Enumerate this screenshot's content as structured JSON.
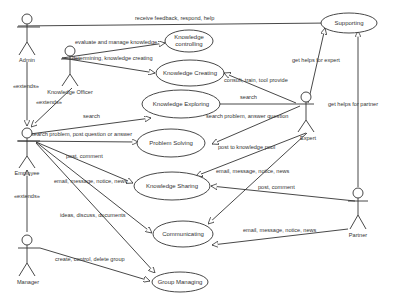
{
  "diagram": {
    "type": "uml-use-case",
    "actors": [
      {
        "id": "admin",
        "label": "Admin"
      },
      {
        "id": "knowledge_officer",
        "label": "Knowledge Officer"
      },
      {
        "id": "employee",
        "label": "Employee"
      },
      {
        "id": "manager",
        "label": "Manager"
      },
      {
        "id": "expert",
        "label": "Expert"
      },
      {
        "id": "partner",
        "label": "Partner"
      }
    ],
    "use_cases": [
      {
        "id": "supporting",
        "label": "Supporting"
      },
      {
        "id": "knowledge_controlling",
        "label_line1": "Knowledge",
        "label_line2": "controlling"
      },
      {
        "id": "knowledge_creating",
        "label": "Knowledge Creating"
      },
      {
        "id": "knowledge_exploring",
        "label": "Knowledge Exploring"
      },
      {
        "id": "problem_solving",
        "label": "Problem Solving"
      },
      {
        "id": "knowledge_sharing",
        "label": "Knowledge Sharing"
      },
      {
        "id": "communicating",
        "label": "Communicating"
      },
      {
        "id": "group_managing",
        "label": "Group Managing"
      }
    ],
    "associations": {
      "admin_supporting": "receive feedback, respond, help",
      "ko_controlling": "evaluate and manage knowledge",
      "ko_creating": "determining, knowledge creating",
      "expert_creating": "consult, train, tool provide",
      "expert_supporting": "get helps for expert",
      "expert_exploring": "search",
      "expert_problem": "search problem, answer question",
      "expert_sharing": "post to knowledge pool",
      "expert_communicating": "email, message, notice, news",
      "employee_exploring": "search",
      "employee_problem": "search problem, post question or answer",
      "employee_sharing_post": "post, comment",
      "employee_sharing_email": "email, message, notice, news",
      "employee_communicating": "ideas, discuss, documents",
      "partner_supporting": "get helps for partner",
      "partner_sharing": "post, comment",
      "partner_communicating": "email, message, notice, news",
      "manager_group": "create, control, delete group"
    },
    "extends": {
      "admin_employee": "«extends»",
      "ko_employee": "«extends»",
      "manager_employee": "«extends»"
    }
  }
}
